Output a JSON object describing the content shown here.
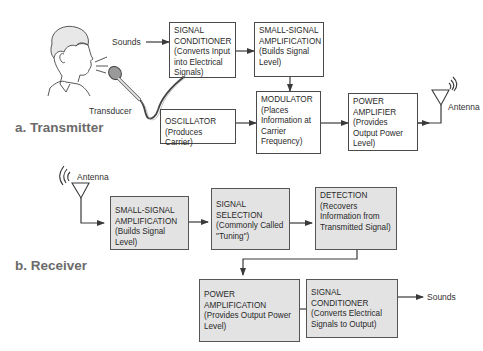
{
  "transmitter": {
    "section_label": "a. Transmitter",
    "input_label": "Sounds",
    "transducer_label": "Transducer",
    "antenna_label": "Antenna",
    "blocks": [
      {
        "title": "SIGNAL CONDITIONER",
        "desc": "(Converts Input into Electrical Signals)"
      },
      {
        "title": "SMALL-SIGNAL AMPLIFICATION",
        "desc": "(Builds Signal Level)"
      },
      {
        "title": "OSCILLATOR",
        "desc": "(Produces Carrier)"
      },
      {
        "title": "MODULATOR",
        "desc": "(Places Information at Carrier Frequency)"
      },
      {
        "title": "POWER AMPLIFIER",
        "desc": "(Provides Output Power Level)"
      }
    ]
  },
  "receiver": {
    "section_label": "b. Receiver",
    "antenna_label": "Antenna",
    "output_label": "Sounds",
    "blocks": [
      {
        "title": "SMALL-SIGNAL AMPLIFICATION",
        "desc": "(Builds Signal Level)"
      },
      {
        "title": "SIGNAL SELECTION",
        "desc": "(Commonly Called \"Tuning\")"
      },
      {
        "title": "DETECTION",
        "desc": "(Recovers Information from Transmitted Signal)"
      },
      {
        "title": "POWER AMPLIFICATION",
        "desc": "(Provides Output Power Level)"
      },
      {
        "title": "SIGNAL CONDITIONER",
        "desc": "(Converts Electrical Signals to Output)"
      }
    ]
  },
  "colors": {
    "line": "#3a3a3a",
    "receiver_fill": "#e3e3e3",
    "section_label": "#6b6b6b"
  }
}
